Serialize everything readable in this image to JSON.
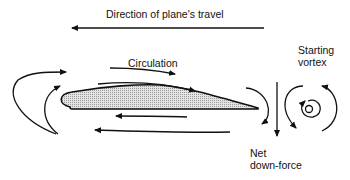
{
  "diagram": {
    "title": "Direction of plane's travel",
    "labels": {
      "circulation": "Circulation",
      "starting_vortex_line1": "Starting",
      "starting_vortex_line2": "vortex",
      "net_line1": "Net",
      "net_line2": "down-force"
    },
    "colors": {
      "stroke": "#111111",
      "airfoil_fill": "#d8d8d8",
      "background": "#ffffff"
    }
  }
}
